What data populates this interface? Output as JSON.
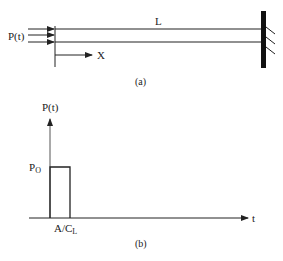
{
  "figure_a": {
    "force_label": "P(t)",
    "length_label": "L",
    "axis_label": "X",
    "caption": "(a)"
  },
  "figure_b": {
    "y_axis_label": "P(t)",
    "amplitude_label": "P",
    "amplitude_sub": "O",
    "duration_label": "A/C",
    "duration_sub": "L",
    "x_axis_label": "t",
    "caption": "(b)"
  },
  "colors": {
    "line": "#222222",
    "wall": "#111111"
  }
}
